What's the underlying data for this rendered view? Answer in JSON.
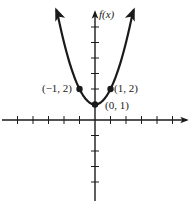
{
  "chart_data": {
    "type": "line",
    "title": "",
    "function": "f(x) = x^2 + 1",
    "xlabel": "",
    "ylabel": "f(x)",
    "xlim": [
      -6,
      6
    ],
    "ylim": [
      -5,
      7.5
    ],
    "grid": false,
    "legend": null,
    "x_ticks_left": 5,
    "x_ticks_right": 5,
    "y_ticks_above": 6,
    "y_ticks_below": 4,
    "series": [
      {
        "name": "f(x)",
        "x": [
          -2.5,
          -2,
          -1.5,
          -1,
          -0.5,
          0,
          0.5,
          1,
          1.5,
          2,
          2.5
        ],
        "values": [
          7.25,
          5,
          3.25,
          2,
          1.25,
          1,
          1.25,
          2,
          3.25,
          5,
          7.25
        ]
      }
    ],
    "points": [
      {
        "x": -1,
        "y": 2,
        "label": "(−1, 2)"
      },
      {
        "x": 0,
        "y": 1,
        "label": "(0, 1)"
      },
      {
        "x": 1,
        "y": 2,
        "label": "(1, 2)"
      }
    ],
    "annotations": [
      "(−1, 2)",
      "(0, 1)",
      "(1, 2)"
    ]
  },
  "labels": {
    "y_axis": "f(x)",
    "point_left": "(−1, 2)",
    "point_vertex": "(0, 1)",
    "point_right": "(1, 2)"
  }
}
